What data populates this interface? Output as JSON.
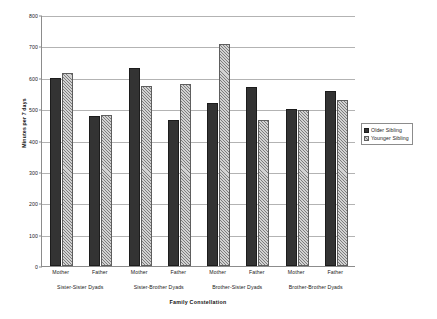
{
  "chart_data": {
    "type": "bar",
    "title": "",
    "xlabel": "Family Constellation",
    "ylabel": "Minutes per 7 days",
    "ylim": [
      0,
      800
    ],
    "ytick_step": 100,
    "yticks": [
      "800",
      "700",
      "600",
      "500",
      "400",
      "300",
      "200",
      "100",
      "0"
    ],
    "grid": true,
    "legend_position": "right",
    "categories": [
      "Mother",
      "Father",
      "Mother",
      "Father",
      "Mother",
      "Father",
      "Mother",
      "Father"
    ],
    "groups": [
      {
        "label": "Sister-Sister Dyads",
        "categories": [
          "Mother",
          "Father"
        ]
      },
      {
        "label": "Sister-Brother Dyads",
        "categories": [
          "Mother",
          "Father"
        ]
      },
      {
        "label": "Brother-Sister Dyads",
        "categories": [
          "Mother",
          "Father"
        ]
      },
      {
        "label": "Brother-Brother Dyads",
        "categories": [
          "Mother",
          "Father"
        ]
      }
    ],
    "series": [
      {
        "name": "Older Sibling",
        "color": "#333333",
        "pattern": "solid",
        "values": [
          598,
          477,
          630,
          465,
          520,
          571,
          500,
          559
        ]
      },
      {
        "name": "Younger Sibling",
        "color": "#d2d2d2",
        "pattern": "diagonal-hatch",
        "values": [
          614,
          480,
          573,
          581,
          707,
          466,
          496,
          529
        ]
      }
    ]
  },
  "legend": {
    "items": [
      {
        "label": "Older Sibling"
      },
      {
        "label": "Younger Sibling"
      }
    ]
  }
}
